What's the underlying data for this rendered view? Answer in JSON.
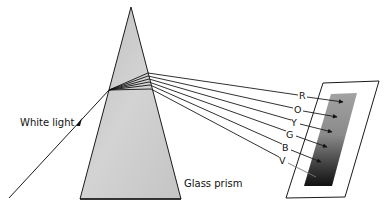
{
  "diagram": {
    "labels": {
      "incoming": "White light",
      "prism": "Glass prism"
    },
    "colors": {
      "prism_light": "#d4d4d4",
      "prism_dark": "#a8a8a8",
      "ray": "#1a1a1a",
      "band_top": "#a0a0a0",
      "band_bottom": "#111111",
      "screen_fill": "#ffffff"
    },
    "spectrum": [
      {
        "key": "R",
        "label": "R",
        "name": "Red"
      },
      {
        "key": "O",
        "label": "O",
        "name": "Orange"
      },
      {
        "key": "Y",
        "label": "Y",
        "name": "Yellow"
      },
      {
        "key": "G",
        "label": "G",
        "name": "Green"
      },
      {
        "key": "B",
        "label": "B",
        "name": "Blue"
      },
      {
        "key": "V",
        "label": "V",
        "name": "Violet"
      }
    ]
  }
}
